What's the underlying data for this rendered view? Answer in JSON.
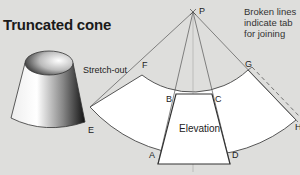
{
  "title": "Truncated cone",
  "note": {
    "line1": "Broken lines",
    "line2": "indicate tab",
    "line3": "for joining"
  },
  "labels": {
    "stretch_out": "Stretch-out",
    "elevation": "Elevation",
    "P": "P",
    "A": "A",
    "B": "B",
    "C": "C",
    "D": "D",
    "E": "E",
    "F": "F",
    "G": "G",
    "H": "H"
  },
  "colors": {
    "background": "#dededc",
    "pattern_fill": "#ffffff",
    "line": "#444444"
  }
}
